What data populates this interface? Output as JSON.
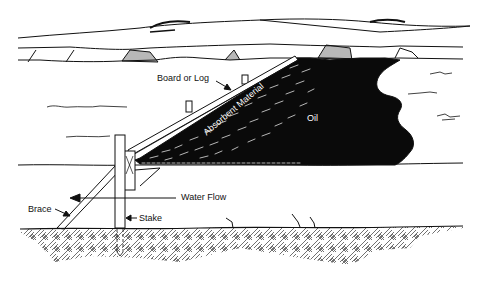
{
  "diagram": {
    "colors": {
      "ink": "#111111",
      "oil": "#0a0a0a",
      "background": "#ffffff"
    },
    "labels": {
      "board": "Board or Log",
      "absorbent": "Absorbent Material",
      "oil": "Oil",
      "water_flow": "Water Flow",
      "brace": "Brace",
      "stake": "Stake"
    },
    "components": [
      {
        "id": "board",
        "label": "Board or Log"
      },
      {
        "id": "absorbent",
        "label": "Absorbent Material"
      },
      {
        "id": "oil",
        "label": "Oil"
      },
      {
        "id": "water-flow",
        "label": "Water Flow"
      },
      {
        "id": "brace",
        "label": "Brace"
      },
      {
        "id": "stake",
        "label": "Stake"
      }
    ]
  }
}
